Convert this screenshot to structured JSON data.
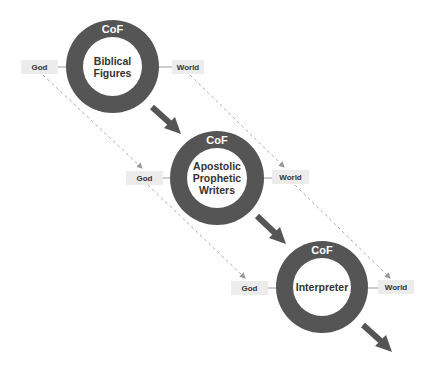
{
  "diagram": {
    "stages": [
      {
        "ring_label": "CoF",
        "name": "Biblical\nFigures",
        "left_tag": "God",
        "right_tag": "World"
      },
      {
        "ring_label": "CoF",
        "name": "Apostolic\nProphetic\nWriters",
        "left_tag": "God",
        "right_tag": "World"
      },
      {
        "ring_label": "CoF",
        "name": "Interpreter",
        "left_tag": "God",
        "right_tag": "World"
      }
    ],
    "colors": {
      "ring": "#555555",
      "arrow": "#555555",
      "tag_bg": "#ececec",
      "dashed_line": "#aaaaaa",
      "text": "#333333"
    }
  }
}
